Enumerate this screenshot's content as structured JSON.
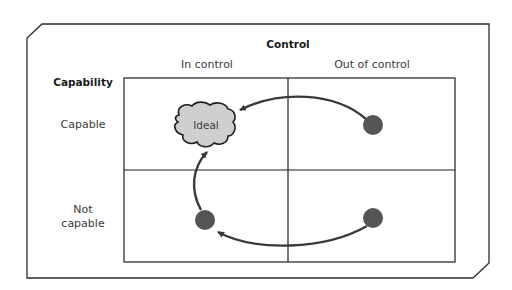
{
  "diagram": {
    "title": "Control",
    "row_header": "Capability",
    "columns": [
      "In control",
      "Out of control"
    ],
    "rows": [
      "Capable",
      "Not\ncapable"
    ],
    "row_labels": {
      "capable": "Capable",
      "not_capable_line1": "Not",
      "not_capable_line2": "capable"
    },
    "column_labels": {
      "in_control": "In control",
      "out_of_control": "Out of control"
    },
    "ideal_label": "Ideal",
    "colors": {
      "frame": "#2b2b2b",
      "grid": "#1e1e1e",
      "dot": "#555555",
      "cloud_fill": "#cfcfcf",
      "arrow": "#3a3a3a"
    },
    "nodes": [
      {
        "id": "ideal",
        "quadrant": "capable / in control",
        "shape": "cloud"
      },
      {
        "id": "capable-out-of-control",
        "quadrant": "capable / out of control",
        "shape": "dot"
      },
      {
        "id": "not-capable-in-control",
        "quadrant": "not capable / in control",
        "shape": "dot"
      },
      {
        "id": "not-capable-out-of-control",
        "quadrant": "not capable / out of control",
        "shape": "dot"
      }
    ],
    "arrows": [
      {
        "from": "capable-out-of-control",
        "to": "ideal"
      },
      {
        "from": "not-capable-out-of-control",
        "to": "not-capable-in-control"
      },
      {
        "from": "not-capable-in-control",
        "to": "ideal"
      }
    ]
  }
}
